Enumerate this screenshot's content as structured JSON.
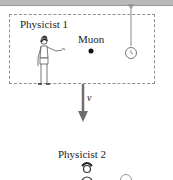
{
  "diagram": {
    "frame_label": "Physicist 1",
    "particle_label": "Muon",
    "velocity_label": "v",
    "ground_label": "Physicist 2"
  },
  "colors": {
    "ceiling": "#b9b9b9",
    "frame_border": "#8f8f8f",
    "arrow": "#6e6e6e",
    "text": "#222222"
  }
}
